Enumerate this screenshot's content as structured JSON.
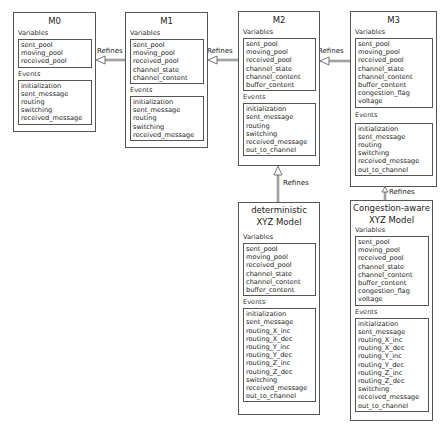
{
  "diagram": {
    "edge_label": "Refines",
    "section_variables": "Variables",
    "section_events": "Events",
    "machines": [
      {
        "id": "M0",
        "title": "M0",
        "variables": [
          "sent_pool",
          "moving_pool",
          "received_pool"
        ],
        "events": [
          "initialization",
          "sent_message",
          "routing",
          "switching",
          "received_message"
        ]
      },
      {
        "id": "M1",
        "title": "M1",
        "variables": [
          "sent_pool",
          "moving_pool",
          "received_pool",
          "channel_state",
          "channel_content"
        ],
        "events": [
          "initialization",
          "sent_message",
          "routing",
          "switching",
          "received_message"
        ]
      },
      {
        "id": "M2",
        "title": "M2",
        "variables": [
          "sent_pool",
          "moving_pool",
          "received_pool",
          "channel_state",
          "channel_content",
          "buffer_content"
        ],
        "events": [
          "initialization",
          "sent_message",
          "routing",
          "switching",
          "received_message",
          "out_to_channel"
        ]
      },
      {
        "id": "M3",
        "title": "M3",
        "variables": [
          "sent_pool",
          "moving_pool",
          "received_pool",
          "channel_state",
          "channel_content",
          "buffer_content",
          "congestion_flag",
          "voltage"
        ],
        "events": [
          "initialization",
          "sent_message",
          "routing",
          "switching",
          "received_message",
          "out_to_channel"
        ]
      },
      {
        "id": "deterministic",
        "title_line1": "deterministic",
        "title_line2": "XYZ Model",
        "variables": [
          "sent_pool",
          "moving_pool",
          "received_pool",
          "channel_state",
          "channel_content",
          "buffer_content"
        ],
        "events": [
          "initialization",
          "sent_message",
          "routing_X_inc",
          "routing_X_dec",
          "routing_Y_inc",
          "routing_Y_dec",
          "routing_Z_inc",
          "routing_Z_dec",
          "switching",
          "received_message",
          "out_to_channel"
        ]
      },
      {
        "id": "congestion",
        "title_line1": "Congestion-aware",
        "title_line2": "XYZ Model",
        "variables": [
          "sent_pool",
          "moving_pool",
          "received_pool",
          "channel_state",
          "channel_content",
          "buffer_content",
          "congestion_flag",
          "voltage"
        ],
        "events": [
          "initialization",
          "sent_message",
          "routing_X_inc",
          "routing_X_dec",
          "routing_Y_inc",
          "routing_Y_dec",
          "routing_Z_inc",
          "routing_Z_dec",
          "switching",
          "received_message",
          "out_to_channel"
        ]
      }
    ],
    "edges": [
      {
        "from": "M1",
        "to": "M0",
        "label": "Refines"
      },
      {
        "from": "M2",
        "to": "M1",
        "label": "Refines"
      },
      {
        "from": "M3",
        "to": "M2",
        "label": "Refines"
      },
      {
        "from": "deterministic",
        "to": "M2",
        "label": "Refines"
      },
      {
        "from": "congestion",
        "to": "M3",
        "label": "Refines"
      }
    ]
  }
}
